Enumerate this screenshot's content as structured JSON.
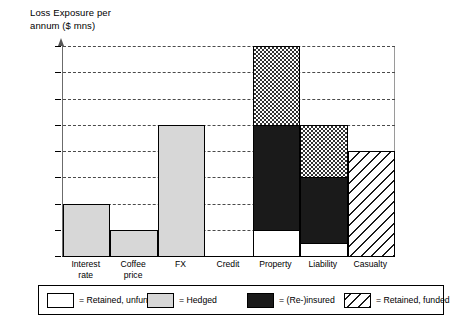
{
  "chart_data": {
    "type": "bar",
    "subtype": "stacked-bar",
    "title": "Loss Exposure per\nannum ($ mns)",
    "xlabel": "",
    "ylabel": "Loss Exposure per annum ($ mns)",
    "ylim": [
      0,
      800
    ],
    "ytick_step": 100,
    "ytick_labels": [
      "800",
      "700",
      "600",
      "500",
      "400",
      "300",
      "200",
      "100",
      "0"
    ],
    "ytick_values": [
      800,
      700,
      600,
      500,
      400,
      300,
      200,
      100,
      0
    ],
    "grid": true,
    "grid_style": "dashed-horizontal",
    "legend_position": "bottom",
    "categories": [
      "Interest\nrate",
      "Coffee\nprice",
      "FX",
      "Credit",
      "Property",
      "Liability",
      "Casualty"
    ],
    "category_names": [
      "Interest rate",
      "Coffee price",
      "FX",
      "Credit",
      "Property",
      "Liability",
      "Casualty"
    ],
    "series": [
      {
        "name": "Retained, unfunded",
        "fill": "white",
        "values": [
          0,
          0,
          0,
          0,
          100,
          50,
          0
        ]
      },
      {
        "name": "(Re-)insured",
        "fill": "black",
        "values": [
          0,
          0,
          0,
          0,
          400,
          250,
          0
        ]
      },
      {
        "name": "Hedged",
        "fill": "light-gray",
        "values": [
          200,
          100,
          500,
          0,
          0,
          0,
          0
        ]
      },
      {
        "name": "Checkered top",
        "fill": "checker",
        "values": [
          0,
          0,
          0,
          0,
          300,
          200,
          0
        ]
      },
      {
        "name": "Retained, funded",
        "fill": "diagonal-hatch",
        "values": [
          0,
          0,
          0,
          0,
          0,
          0,
          400
        ]
      }
    ],
    "totals": [
      200,
      100,
      500,
      0,
      800,
      500,
      400
    ],
    "columns": [
      {
        "label": "Interest\nrate",
        "total": 200,
        "segments": [
          {
            "label": "Hedged",
            "fill": "hedged",
            "from": 0,
            "to": 200,
            "value": 200
          }
        ]
      },
      {
        "label": "Coffee\nprice",
        "total": 100,
        "segments": [
          {
            "label": "Hedged",
            "fill": "hedged",
            "from": 0,
            "to": 100,
            "value": 100
          }
        ]
      },
      {
        "label": "FX",
        "total": 500,
        "segments": [
          {
            "label": "Hedged",
            "fill": "hedged",
            "from": 0,
            "to": 500,
            "value": 500
          }
        ]
      },
      {
        "label": "Credit",
        "total": 0,
        "segments": []
      },
      {
        "label": "Property",
        "total": 800,
        "segments": [
          {
            "label": "Retained, unfunded",
            "fill": "unfunded",
            "from": 0,
            "to": 100,
            "value": 100
          },
          {
            "label": "(Re-)insured",
            "fill": "insured",
            "from": 100,
            "to": 500,
            "value": 400
          },
          {
            "label": "Checkered",
            "fill": "checker",
            "from": 500,
            "to": 800,
            "value": 300
          }
        ]
      },
      {
        "label": "Liability",
        "total": 500,
        "segments": [
          {
            "label": "Retained, unfunded",
            "fill": "unfunded",
            "from": 0,
            "to": 50,
            "value": 50
          },
          {
            "label": "(Re-)insured",
            "fill": "insured",
            "from": 50,
            "to": 300,
            "value": 250
          },
          {
            "label": "Checkered",
            "fill": "checker",
            "from": 300,
            "to": 500,
            "value": 200
          }
        ]
      },
      {
        "label": "Casualty",
        "total": 400,
        "segments": [
          {
            "label": "Retained, funded",
            "fill": "funded",
            "from": 0,
            "to": 400,
            "value": 400
          }
        ]
      }
    ],
    "legend": [
      {
        "swatch": "unfunded",
        "label": "= Retained, unfunded"
      },
      {
        "swatch": "hedged",
        "label": "= Hedged"
      },
      {
        "swatch": "insured",
        "label": "= (Re-)insured"
      },
      {
        "swatch": "funded",
        "label": "= Retained, funded"
      }
    ],
    "colors": {
      "unfunded": "#ffffff",
      "hedged": "#d7d7d7",
      "insured": "#1a1a1a",
      "checker": "#333333",
      "funded": "#1a1a1a",
      "axis": "#000000",
      "grid": "#4a4a4a",
      "background": "#ffffff"
    }
  }
}
